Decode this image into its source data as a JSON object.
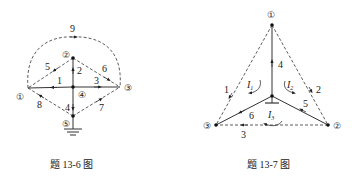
{
  "figures": [
    {
      "id": "fig-13-6",
      "caption": "题 13-6 图",
      "nodes": [
        {
          "label": "1",
          "x": 28,
          "y": 88
        },
        {
          "label": "2",
          "x": 73,
          "y": 58
        },
        {
          "label": "3",
          "x": 120,
          "y": 87
        },
        {
          "label": "4",
          "x": 73,
          "y": 87
        },
        {
          "label": "5",
          "x": 73,
          "y": 116
        }
      ],
      "ground_node": "5",
      "branches": [
        {
          "label": "1",
          "from": "4",
          "to": "1",
          "style": "solid"
        },
        {
          "label": "2",
          "from": "4",
          "to": "2",
          "style": "solid"
        },
        {
          "label": "3",
          "from": "4",
          "to": "3",
          "style": "solid"
        },
        {
          "label": "4",
          "from": "4",
          "to": "5",
          "style": "solid"
        },
        {
          "label": "5",
          "from": "2",
          "to": "1",
          "style": "dashed"
        },
        {
          "label": "6",
          "from": "2",
          "to": "3",
          "style": "dashed"
        },
        {
          "label": "7",
          "from": "5",
          "to": "3",
          "style": "dashed"
        },
        {
          "label": "8",
          "from": "5",
          "to": "1",
          "style": "dashed"
        },
        {
          "label": "9",
          "from": "1",
          "to": "3",
          "style": "dashed-arc"
        }
      ]
    },
    {
      "id": "fig-13-7",
      "caption": "题 13-7 图",
      "nodes": [
        {
          "label": "1",
          "x": 272,
          "y": 25
        },
        {
          "label": "2",
          "x": 328,
          "y": 125
        },
        {
          "label": "3",
          "x": 216,
          "y": 125
        },
        {
          "label": "0",
          "x": 272,
          "y": 96
        }
      ],
      "ground_node": "0",
      "branches": [
        {
          "label": "1",
          "from": "1",
          "to": "3",
          "style": "dashed"
        },
        {
          "label": "2",
          "from": "1",
          "to": "2",
          "style": "dashed"
        },
        {
          "label": "3",
          "from": "2",
          "to": "3",
          "style": "dashed"
        },
        {
          "label": "4",
          "from": "0",
          "to": "1",
          "style": "solid"
        },
        {
          "label": "5",
          "from": "2",
          "to": "0",
          "style": "solid"
        },
        {
          "label": "6",
          "from": "0",
          "to": "3",
          "style": "solid"
        }
      ],
      "loop_currents": [
        {
          "symbol": "I",
          "sub": "1"
        },
        {
          "symbol": "I",
          "sub": "2"
        },
        {
          "symbol": "I",
          "sub": "3"
        }
      ]
    }
  ],
  "labels": {
    "node_circled": [
      "①",
      "②",
      "③",
      "④",
      "⑤"
    ],
    "fig1_branches": [
      "1",
      "2",
      "3",
      "4",
      "5",
      "6",
      "7",
      "8",
      "9"
    ],
    "fig2_branches": [
      "1",
      "2",
      "3",
      "4",
      "5",
      "6"
    ],
    "fig2_nodes": [
      "①",
      "②",
      "③"
    ],
    "loop_I": "I",
    "loop_subs": [
      "1",
      "2",
      "3"
    ],
    "caption1": "题 13-6 图",
    "caption2": "题 13-7 图"
  },
  "colors": {
    "line": "#333333",
    "text": "#222222",
    "background": "#ffffff"
  }
}
